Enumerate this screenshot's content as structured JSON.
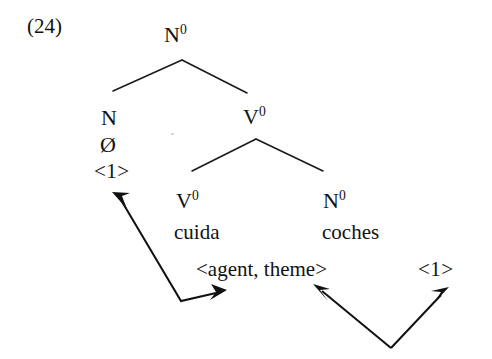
{
  "figure": {
    "example_number": "(24)",
    "caption_language": "Spanish",
    "background_color": "#ffffff",
    "ink_color": "#111111"
  },
  "tree": {
    "root": {
      "label": "N",
      "superscript": "0"
    },
    "left_branch": {
      "category": "N",
      "exponent": "Ø",
      "index": "<1>"
    },
    "right_branch": {
      "label": "V",
      "superscript": "0",
      "children": [
        {
          "label": "V",
          "superscript": "0",
          "word": "cuida"
        },
        {
          "label": "N",
          "superscript": "0",
          "word": "coches"
        }
      ]
    }
  },
  "annotations": {
    "theta_grid": "<agent, theme>",
    "right_index": "<1>"
  },
  "arrows": [
    {
      "name": "index-to-agent",
      "description": "bent double-headed arrow from left index <1> down and right to <agent, theme>",
      "heads": 2
    },
    {
      "name": "theme-to-index",
      "description": "V-shaped double-headed arrow joining <agent, theme> and right index <1>",
      "heads": 2
    }
  ]
}
